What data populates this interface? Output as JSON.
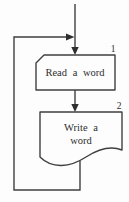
{
  "diagram": {
    "type": "flowchart",
    "background_color": "#fdfdfd",
    "stroke_color": "#3f3f3f",
    "text_color": "#2e2e2e",
    "nodes": [
      {
        "id": "read",
        "shape": "card",
        "label": "Read a word",
        "number": "1"
      },
      {
        "id": "write",
        "shape": "document",
        "label_line1": "Write a",
        "label_line2": "word",
        "number": "2"
      }
    ],
    "edges": [
      {
        "from": "start",
        "to": "read",
        "style": "arrow-down"
      },
      {
        "from": "read",
        "to": "write",
        "style": "arrow-down"
      },
      {
        "from": "write",
        "to": "start",
        "style": "loop-back-left"
      }
    ]
  }
}
